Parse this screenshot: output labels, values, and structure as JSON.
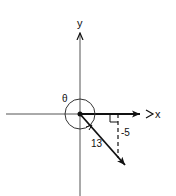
{
  "diagram": {
    "type": "reference-angle-vector",
    "axes": {
      "x_label": "x",
      "y_label": "y"
    },
    "angle_label": "θ",
    "vector_length_label": "13",
    "vertical_leg_label": "-5",
    "colors": {
      "stroke": "#111111",
      "background": "#ffffff"
    }
  }
}
